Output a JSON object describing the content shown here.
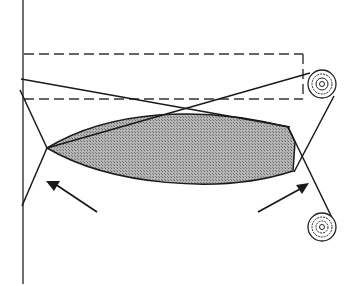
{
  "diagram": {
    "colors": {
      "stroke": "#1a1a1a",
      "fill": "#9a9a9a",
      "background": "#ffffff"
    },
    "elements": {
      "wall_line": "vertical-line",
      "dashed_box": "dashed-rectangle",
      "shaded_body": "lens-shape",
      "top_roll": "roll",
      "bottom_roll": "roll",
      "left_arrow": "arrow-up-left",
      "right_arrow": "arrow-up-right"
    }
  }
}
